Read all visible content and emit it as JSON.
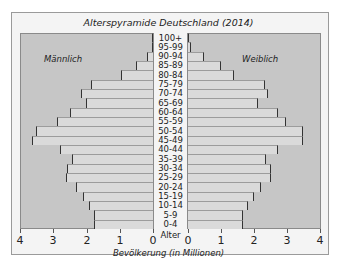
{
  "chart_data": {
    "type": "bar",
    "subtype": "population-pyramid",
    "title": "Alterspyramide Deutschland (2014)",
    "xlabel": "Bevölkerung (in Millionen)",
    "ylabel": "Alter",
    "xlim": [
      0,
      4
    ],
    "xticks": [
      4,
      3,
      2,
      1,
      0,
      0,
      1,
      2,
      3,
      4
    ],
    "legend": [
      "Männlich",
      "Weiblich"
    ],
    "categories": [
      "100+",
      "95-99",
      "90-94",
      "85-89",
      "80-84",
      "75-79",
      "70-74",
      "65-69",
      "60-64",
      "55-59",
      "50-54",
      "45-49",
      "40-44",
      "35-39",
      "30-34",
      "25-29",
      "20-24",
      "15-19",
      "10-14",
      "5-9",
      "0-4"
    ],
    "series": [
      {
        "name": "Männlich",
        "side": "left",
        "values": [
          0.0,
          0.03,
          0.18,
          0.5,
          0.97,
          1.87,
          2.17,
          2.02,
          2.5,
          2.9,
          3.52,
          3.64,
          2.8,
          2.44,
          2.59,
          2.62,
          2.32,
          2.11,
          1.93,
          1.78,
          1.78
        ]
      },
      {
        "name": "Weiblich",
        "side": "right",
        "values": [
          0.03,
          0.1,
          0.48,
          1.0,
          1.4,
          2.33,
          2.42,
          2.12,
          2.7,
          2.94,
          3.45,
          3.45,
          2.7,
          2.36,
          2.5,
          2.5,
          2.2,
          2.0,
          1.82,
          1.67,
          1.67
        ]
      }
    ],
    "grid": false
  },
  "labels": {
    "title": "Alterspyramide Deutschland (2014)",
    "male": "Männlich",
    "female": "Weiblich",
    "age_axis": "Alter",
    "x_axis": "Bevölkerung (in Millionen)"
  },
  "colors": {
    "plot_bg": "#c6c6c6",
    "bar_fill": "#dadada",
    "bar_edge": "#333333",
    "frame_bg": "#f4f4f4"
  }
}
